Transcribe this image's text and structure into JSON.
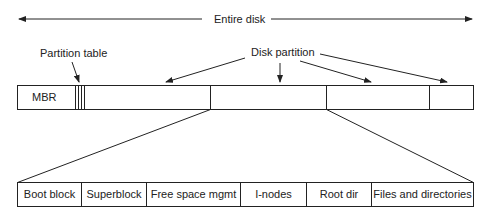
{
  "labels": {
    "entire_disk": "Entire disk",
    "partition_table": "Partition table",
    "disk_partition": "Disk partition",
    "mbr": "MBR"
  },
  "partition_layout": [
    {
      "label": "Boot block"
    },
    {
      "label": "Superblock"
    },
    {
      "label": "Free space mgmt"
    },
    {
      "label": "I-nodes"
    },
    {
      "label": "Root dir"
    },
    {
      "label": "Files and directories"
    }
  ],
  "colors": {
    "line": "#222222",
    "background": "#ffffff"
  }
}
